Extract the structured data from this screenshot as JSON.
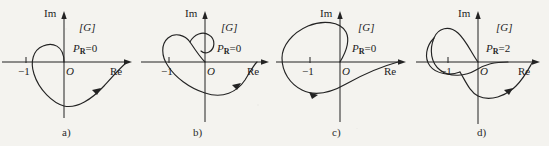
{
  "figure": {
    "background_color": "#f4f3ef",
    "ink_color": "#232323",
    "width": 549,
    "height": 146,
    "axis_labels": {
      "imaginary": "Im",
      "real": "Re",
      "origin": "O",
      "minus_one": "−1"
    },
    "plane_tag": "[G]"
  },
  "panels": [
    {
      "id": "a",
      "caption": "a)",
      "plane_tag": "[G]",
      "im_label": "Im",
      "re_label": "Re",
      "origin_label": "O",
      "minus_one_label": "−1",
      "pr_symbol": "P",
      "pr_subscript": "R",
      "pr_equals": "=",
      "pr_value": "0",
      "pr_text": "P_R=0",
      "encirclements": 0,
      "description": "Nyquist contour with one small loop crossing to the left of the origin, not enclosing −1"
    },
    {
      "id": "b",
      "caption": "b)",
      "plane_tag": "[G]",
      "im_label": "Im",
      "re_label": "Re",
      "origin_label": "O",
      "minus_one_label": "−1",
      "pr_symbol": "P",
      "pr_subscript": "R",
      "pr_equals": "=",
      "pr_value": "0",
      "pr_text": "P_R=0",
      "encirclements": 0,
      "description": "Nyquist contour with an upper hooked loop and a large lower lobe, −1 not encircled"
    },
    {
      "id": "c",
      "caption": "c)",
      "plane_tag": "[G]",
      "im_label": "Im",
      "re_label": "Re",
      "origin_label": "O",
      "minus_one_label": "−1",
      "pr_symbol": "P",
      "pr_subscript": "R",
      "pr_equals": "=",
      "pr_value": "0",
      "pr_text": "P_R=0",
      "encirclements": 0,
      "description": "Nyquist contour with a wide upper-left loop passing left of −1 and a lower sweep returning to the origin"
    },
    {
      "id": "d",
      "caption": "d)",
      "plane_tag": "[G]",
      "im_label": "Im",
      "re_label": "Re",
      "origin_label": "O",
      "minus_one_label": "−1",
      "pr_symbol": "P",
      "pr_subscript": "R",
      "pr_equals": "=",
      "pr_value": "2",
      "pr_text": "P_R=2",
      "encirclements": 2,
      "description": "Nyquist contour with a tall egg-shaped loop enclosing −1 twice plus a lower lobe"
    }
  ]
}
